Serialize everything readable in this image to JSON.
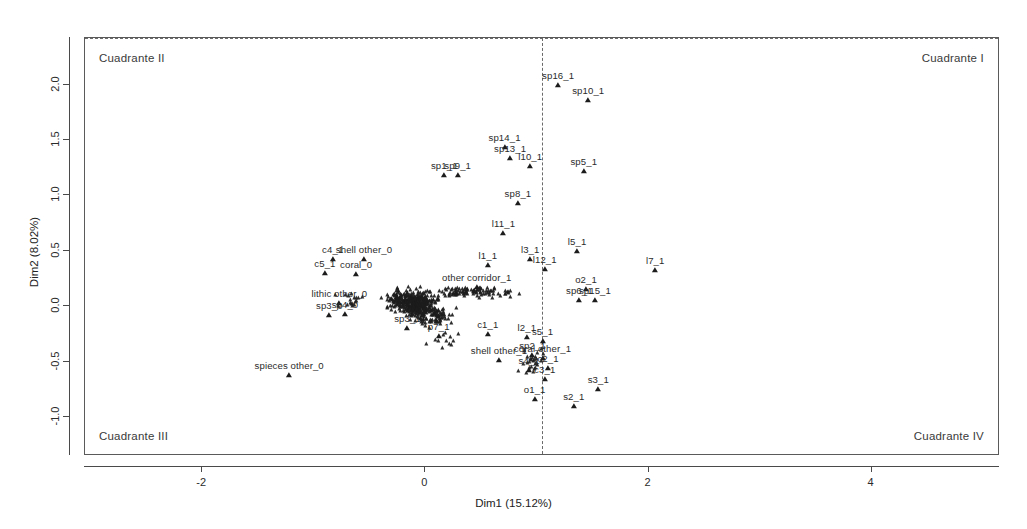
{
  "chart_data": {
    "type": "scatter",
    "title": "",
    "xlabel": "Dim1 (15.12%)",
    "ylabel": "Dim2 (8.02%)",
    "xlim": [
      -3.05,
      5.15
    ],
    "ylim": [
      -1.35,
      2.42
    ],
    "xticks": [
      -2,
      0,
      2,
      4
    ],
    "xticklabels": [
      "-2",
      "0",
      "2",
      "4"
    ],
    "yticks": [
      2.0,
      1.5,
      1.0,
      0.5,
      0.0,
      -0.5,
      -1.0
    ],
    "yticklabels": [
      "2.0",
      "1.5",
      "1.0",
      "0.5",
      "0.0",
      "-0.5",
      "-1.0"
    ],
    "grid": false,
    "legend": null,
    "reference_lines": {
      "vertical_x": 0,
      "horizontal_y": 0,
      "style": "dashed"
    },
    "quadrant_labels": {
      "q1": "Cuadrante I",
      "q2": "Cuadrante II",
      "q3": "Cuadrante III",
      "q4": "Cuadrante IV"
    },
    "marker": "filled-triangle",
    "marker_color": "#1c1c1c",
    "labeled_points": [
      {
        "label": "sp16_1",
        "x": 1.19,
        "y": 2.0
      },
      {
        "label": "sp10_1",
        "x": 1.46,
        "y": 1.86
      },
      {
        "label": "sp14_1",
        "x": 0.71,
        "y": 1.44
      },
      {
        "label": "sp13_1",
        "x": 0.76,
        "y": 1.34
      },
      {
        "label": "l10_1",
        "x": 0.94,
        "y": 1.27
      },
      {
        "label": "sp5_1",
        "x": 1.42,
        "y": 1.22
      },
      {
        "label": "sp1_1",
        "x": 0.17,
        "y": 1.18
      },
      {
        "label": "sp9_1",
        "x": 0.29,
        "y": 1.18
      },
      {
        "label": "sp8_1",
        "x": 0.83,
        "y": 0.93
      },
      {
        "label": "l11_1",
        "x": 0.7,
        "y": 0.66
      },
      {
        "label": "l5_1",
        "x": 1.36,
        "y": 0.5
      },
      {
        "label": "l3_1",
        "x": 0.94,
        "y": 0.43
      },
      {
        "label": "l7_1",
        "x": 2.06,
        "y": 0.33
      },
      {
        "label": "l12_1",
        "x": 1.07,
        "y": 0.34
      },
      {
        "label": "l1_1",
        "x": 0.56,
        "y": 0.37
      },
      {
        "label": "c4_1",
        "x": -0.83,
        "y": 0.43
      },
      {
        "label": "shell other_0",
        "x": -0.55,
        "y": 0.43
      },
      {
        "label": "c5_1",
        "x": -0.9,
        "y": 0.3
      },
      {
        "label": "coral_0",
        "x": -0.62,
        "y": 0.29
      },
      {
        "label": "o2_1",
        "x": 1.44,
        "y": 0.16
      },
      {
        "label": "sp6_1",
        "x": 1.38,
        "y": 0.06
      },
      {
        "label": "sp15_1",
        "x": 1.52,
        "y": 0.06
      },
      {
        "label": "other corridor_1",
        "x": 0.46,
        "y": 0.17
      },
      {
        "label": "lithic other_0",
        "x": -0.77,
        "y": 0.03
      },
      {
        "label": "sp3_0",
        "x": -0.86,
        "y": -0.08
      },
      {
        "label": "sp4_0",
        "x": -0.72,
        "y": -0.07
      },
      {
        "label": "sp3_1",
        "x": -0.16,
        "y": -0.2
      },
      {
        "label": "p7_1",
        "x": 0.12,
        "y": -0.27
      },
      {
        "label": "c1_1",
        "x": 0.56,
        "y": -0.25
      },
      {
        "label": "l2_1",
        "x": 0.91,
        "y": -0.28
      },
      {
        "label": "s5_1",
        "x": 1.05,
        "y": -0.31
      },
      {
        "label": "spieces other_0",
        "x": -1.22,
        "y": -0.62
      },
      {
        "label": "shell other_1",
        "x": 0.66,
        "y": -0.48
      },
      {
        "label": "coral other_1",
        "x": 1.05,
        "y": -0.47
      },
      {
        "label": "sp2_1",
        "x": 0.96,
        "y": -0.44
      },
      {
        "label": "s4_1",
        "x": 0.93,
        "y": -0.57
      },
      {
        "label": "c2_1",
        "x": 1.1,
        "y": -0.56
      },
      {
        "label": "c3_1",
        "x": 1.07,
        "y": -0.66
      },
      {
        "label": "o1_1",
        "x": 0.98,
        "y": -0.84
      },
      {
        "label": "s2_1",
        "x": 1.33,
        "y": -0.9
      },
      {
        "label": "s3_1",
        "x": 1.55,
        "y": -0.75
      }
    ]
  },
  "figure": {
    "axis_color": "#4a4a4a",
    "text_color": "#2b2b2b",
    "background": "#ffffff"
  }
}
